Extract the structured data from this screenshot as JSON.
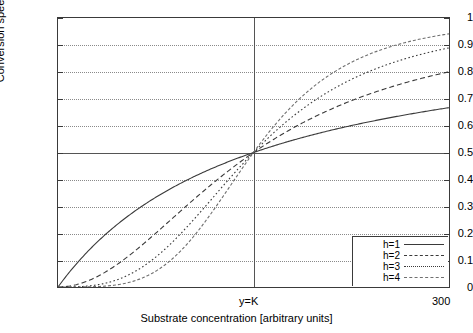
{
  "chart_data": {
    "type": "line",
    "title": "",
    "xlabel": "Substrate concentration [arbitrary units]",
    "ylabel": "Conversion speed [arbitrary units]",
    "xlim": [
      0,
      300
    ],
    "ylim": [
      0,
      1
    ],
    "grid": true,
    "legend_position": "bottom-right",
    "x_tick_labels": [
      "y=K",
      "300"
    ],
    "x_tick_values": [
      150,
      300
    ],
    "y_tick_labels": [
      "0",
      "0.1",
      "0.2",
      "0.3",
      "0.4",
      "0.5",
      "0.6",
      "0.7",
      "0.8",
      "0.9",
      "1"
    ],
    "y_tick_values": [
      0,
      0.1,
      0.2,
      0.3,
      0.4,
      0.5,
      0.6,
      0.7,
      0.8,
      0.9,
      1
    ],
    "annotations": [
      "All curves intersect at (K, 0.5)"
    ],
    "K": 150,
    "series": [
      {
        "name": "h=1",
        "hill_coefficient": 1,
        "style": "solid",
        "color": "#3a3a3a",
        "x": [
          0,
          15,
          30,
          45,
          60,
          75,
          90,
          105,
          120,
          135,
          150,
          165,
          180,
          195,
          210,
          225,
          240,
          255,
          270,
          285,
          300
        ],
        "values": [
          0.0,
          0.091,
          0.167,
          0.231,
          0.286,
          0.333,
          0.375,
          0.412,
          0.444,
          0.474,
          0.5,
          0.524,
          0.545,
          0.565,
          0.583,
          0.6,
          0.615,
          0.63,
          0.643,
          0.655,
          0.667
        ]
      },
      {
        "name": "h=2",
        "hill_coefficient": 2,
        "style": "dashed",
        "color": "#3a3a3a",
        "x": [
          0,
          15,
          30,
          45,
          60,
          75,
          90,
          105,
          120,
          135,
          150,
          165,
          180,
          195,
          210,
          225,
          240,
          255,
          270,
          285,
          300
        ],
        "values": [
          0.0,
          0.01,
          0.038,
          0.083,
          0.138,
          0.2,
          0.265,
          0.329,
          0.39,
          0.447,
          0.5,
          0.548,
          0.59,
          0.628,
          0.662,
          0.692,
          0.719,
          0.743,
          0.764,
          0.783,
          0.8
        ]
      },
      {
        "name": "h=3",
        "hill_coefficient": 3,
        "style": "dotted",
        "color": "#3a3a3a",
        "x": [
          0,
          15,
          30,
          45,
          60,
          75,
          90,
          105,
          120,
          135,
          150,
          165,
          180,
          195,
          210,
          225,
          240,
          255,
          270,
          285,
          300
        ],
        "values": [
          0.0,
          0.001,
          0.008,
          0.026,
          0.06,
          0.111,
          0.178,
          0.255,
          0.338,
          0.421,
          0.5,
          0.571,
          0.633,
          0.687,
          0.732,
          0.771,
          0.803,
          0.83,
          0.853,
          0.873,
          0.889
        ]
      },
      {
        "name": "h=4",
        "hill_coefficient": 4,
        "style": "fine-dashed",
        "color": "#6f6f6f",
        "x": [
          0,
          15,
          30,
          45,
          60,
          75,
          90,
          105,
          120,
          135,
          150,
          165,
          180,
          195,
          210,
          225,
          240,
          255,
          270,
          285,
          300
        ],
        "values": [
          0.0,
          0.0001,
          0.0016,
          0.008,
          0.025,
          0.058,
          0.115,
          0.196,
          0.291,
          0.39,
          0.5,
          0.594,
          0.674,
          0.738,
          0.789,
          0.829,
          0.86,
          0.885,
          0.905,
          0.921,
          0.934
        ]
      }
    ]
  },
  "legend": {
    "items": [
      {
        "label": "h=1"
      },
      {
        "label": "h=2"
      },
      {
        "label": "h=3"
      },
      {
        "label": "h=4"
      }
    ]
  }
}
